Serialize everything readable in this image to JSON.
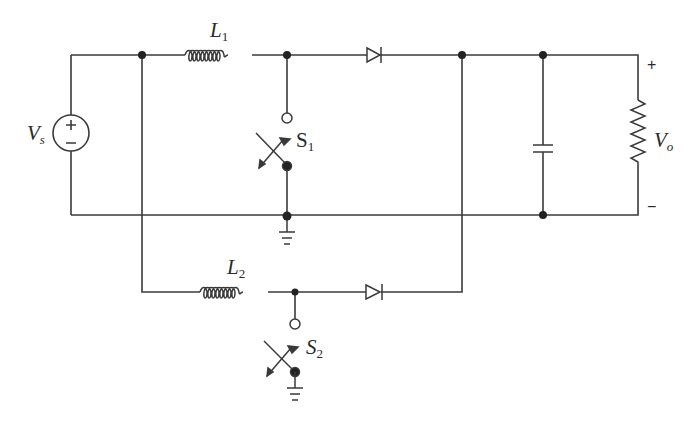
{
  "diagram": {
    "title": "",
    "type": "circuit-schematic",
    "colors": {
      "wire": "#3a3a3a",
      "background": "#ffffff"
    },
    "labels": {
      "source": {
        "main": "V",
        "sub": "s"
      },
      "source_plus": "+",
      "source_minus": "−",
      "inductor1": {
        "main": "L",
        "sub": "1"
      },
      "inductor2": {
        "main": "L",
        "sub": "2"
      },
      "switch1": {
        "main": "S",
        "sub": "1"
      },
      "switch2": {
        "main": "S",
        "sub": "2"
      },
      "output": {
        "main": "V",
        "sub": "o"
      },
      "output_plus": "+",
      "output_minus": "−"
    },
    "components": [
      {
        "id": "Vs",
        "type": "dc-voltage-source"
      },
      {
        "id": "L1",
        "type": "inductor"
      },
      {
        "id": "L2",
        "type": "inductor"
      },
      {
        "id": "S1",
        "type": "switch"
      },
      {
        "id": "S2",
        "type": "switch"
      },
      {
        "id": "D1",
        "type": "diode"
      },
      {
        "id": "D2",
        "type": "diode"
      },
      {
        "id": "C",
        "type": "capacitor"
      },
      {
        "id": "R",
        "type": "resistor"
      },
      {
        "id": "GND1",
        "type": "ground"
      },
      {
        "id": "GND2",
        "type": "ground"
      }
    ]
  }
}
